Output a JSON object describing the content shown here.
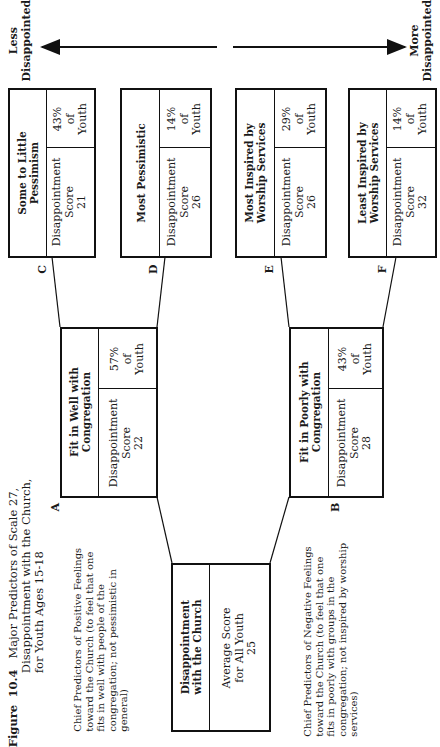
{
  "figure": {
    "label": "Figure",
    "number": "10.4",
    "title_lines": [
      "Major Predictors of Scale 27,",
      "Disappointment with the Church,",
      "for Youth Ages 15-18"
    ]
  },
  "axis": {
    "less_label_lines": [
      "Less",
      "Disappointed"
    ],
    "more_label_lines": [
      "More",
      "Disappointed"
    ]
  },
  "root": {
    "title_lines": [
      "Disappointment",
      "with the Church"
    ],
    "body_lines": [
      "Average Score",
      "for All Youth",
      "25"
    ]
  },
  "nodes": [
    {
      "id": "A",
      "title_lines": [
        "Fit in Well with",
        "Congregation"
      ],
      "score_label_lines": [
        "Disappointment",
        "Score"
      ],
      "score": "22",
      "pct_lines": [
        "57%",
        "of",
        "Youth"
      ]
    },
    {
      "id": "B",
      "title_lines": [
        "Fit in Poorly with",
        "Congregation"
      ],
      "score_label_lines": [
        "Disappointment",
        "Score"
      ],
      "score": "28",
      "pct_lines": [
        "43%",
        "of",
        "Youth"
      ]
    },
    {
      "id": "C",
      "title_lines": [
        "Some to Little",
        "Pessimism"
      ],
      "score_label_lines": [
        "Disappointment",
        "Score"
      ],
      "score": "21",
      "pct_lines": [
        "43%",
        "of",
        "Youth"
      ]
    },
    {
      "id": "D",
      "title_lines": [
        "Most Pessimistic"
      ],
      "score_label_lines": [
        "Disappointment",
        "Score"
      ],
      "score": "26",
      "pct_lines": [
        "14%",
        "of",
        "Youth"
      ]
    },
    {
      "id": "E",
      "title_lines": [
        "Most Inspired by",
        "Worship Services"
      ],
      "score_label_lines": [
        "Disappointment",
        "Score"
      ],
      "score": "26",
      "pct_lines": [
        "29%",
        "of",
        "Youth"
      ]
    },
    {
      "id": "F",
      "title_lines": [
        "Least Inspired by",
        "Worship Services"
      ],
      "score_label_lines": [
        "Disappointment",
        "Score"
      ],
      "score": "32",
      "pct_lines": [
        "14%",
        "of",
        "Youth"
      ]
    }
  ],
  "notes": {
    "positive_lines": [
      "Chief Predictors of Positive Feelings",
      "toward the Church (to feel that one",
      "fits in well with people of the",
      "congregation; not pessimistic in",
      "general)"
    ],
    "negative_lines": [
      "Chief Predictors of Negative Feelings",
      "toward the Church (to feel that one",
      "fits in poorly with groups in the",
      "congregation; not inspired by worship",
      "services)"
    ]
  }
}
